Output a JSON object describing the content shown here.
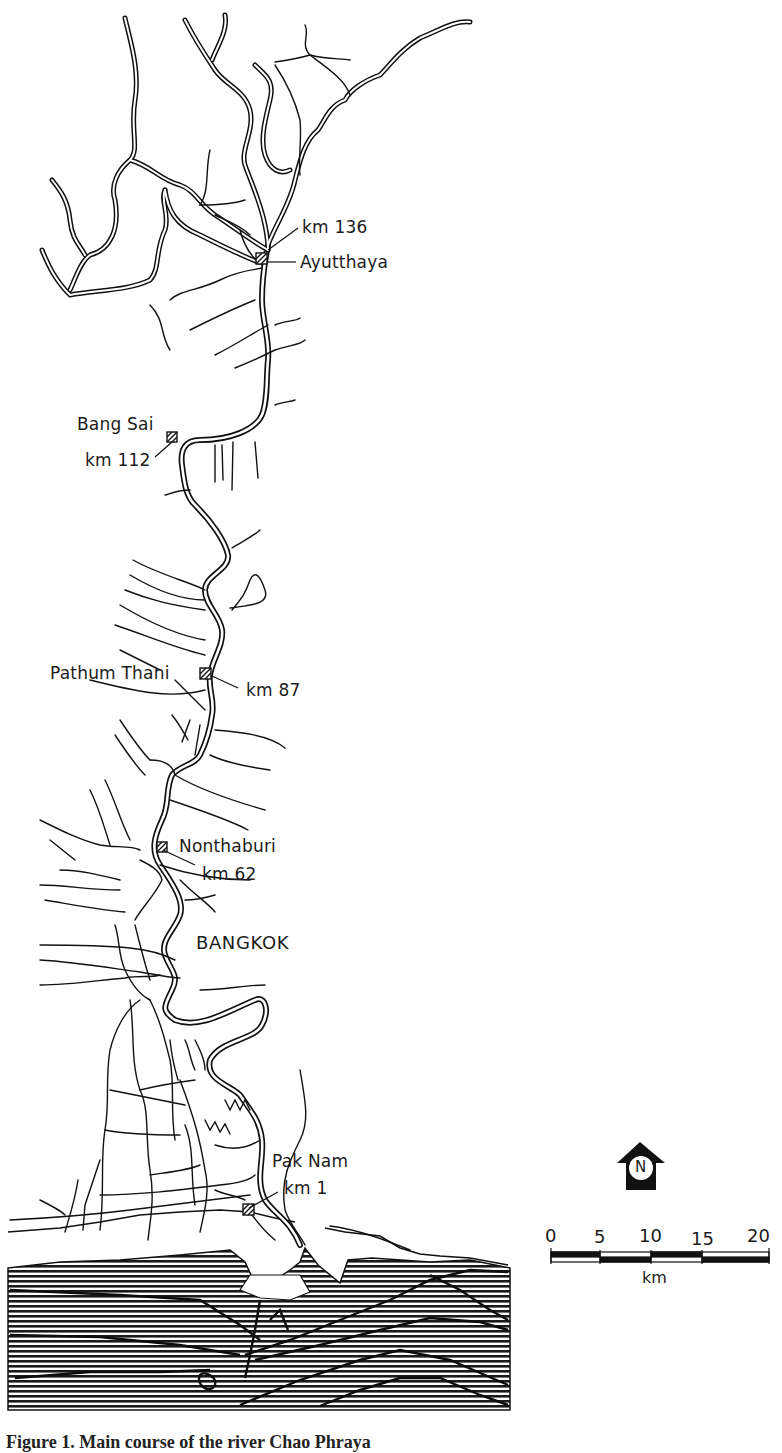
{
  "map": {
    "title": "Chao Phraya River: Ayutthaya to Gulf of Thailand",
    "places": [
      {
        "name": "Ayutthaya",
        "km_label": "km 136"
      },
      {
        "name": "Bang Sai",
        "km_label": "km 112"
      },
      {
        "name": "Pathum Thani",
        "km_label": "km 87"
      },
      {
        "name": "Nonthaburi",
        "km_label": "km 62"
      },
      {
        "name": "BANGKOK",
        "km_label": ""
      },
      {
        "name": "Pak Nam",
        "km_label": "km 1"
      }
    ],
    "north_arrow": {
      "letter": "N"
    },
    "scale_bar": {
      "ticks": [
        "0",
        "5",
        "10",
        "15",
        "20"
      ],
      "unit": "km"
    },
    "caption": "Figure 1. Main course of the river Chao Phraya"
  }
}
